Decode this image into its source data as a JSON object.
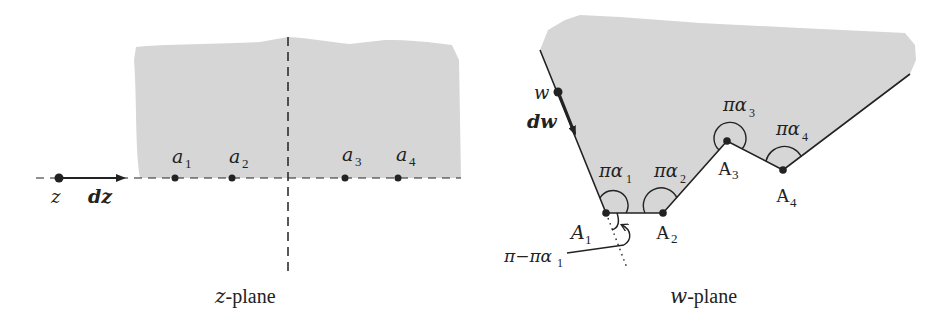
{
  "figure": {
    "colors": {
      "region_fill": "#d6d6d6",
      "ink": "#222222",
      "background": "#ffffff"
    },
    "z_plane": {
      "caption_var": "z",
      "caption_suffix": "-plane",
      "point_label": "z",
      "differential_label": "dz",
      "prevertices": [
        {
          "name": "a",
          "sub": "1",
          "x": 175
        },
        {
          "name": "a",
          "sub": "2",
          "x": 232
        },
        {
          "name": "a",
          "sub": "3",
          "x": 345
        },
        {
          "name": "a",
          "sub": "4",
          "x": 398
        }
      ]
    },
    "w_plane": {
      "caption_var": "w",
      "caption_suffix": "-plane",
      "point_label": "w",
      "differential_label": "dw",
      "vertices": [
        {
          "name": "A",
          "sub": "1",
          "angle_label": "πα",
          "angle_sub": "1"
        },
        {
          "name": "A",
          "sub": "2",
          "angle_label": "πα",
          "angle_sub": "2"
        },
        {
          "name": "A",
          "sub": "3",
          "angle_label": "πα",
          "angle_sub": "3"
        },
        {
          "name": "A",
          "sub": "4",
          "angle_label": "πα",
          "angle_sub": "4"
        }
      ],
      "exterior_angle_label": "π−πα",
      "exterior_angle_sub": "1"
    }
  }
}
